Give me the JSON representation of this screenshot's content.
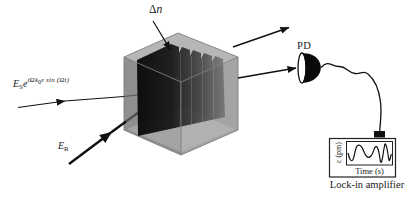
{
  "figure": {
    "type": "optics-experiment-diagram",
    "labels": {
      "grating": {
        "delta": "Δ",
        "n": "n"
      },
      "signal_beam": {
        "E": "E",
        "E_sub": "S",
        "e": "e",
        "exp_i": "iΩ",
        "exp_k": "k",
        "exp_k_sub": "0",
        "exp_tail": "ε sin (Ωt)"
      },
      "reference_beam": {
        "E": "E",
        "E_sub": "R"
      },
      "photodetector": "PD"
    },
    "lockin": {
      "ylabel": "ε (pm)",
      "xlabel": "Time (s)",
      "caption": "Lock-in amplifier"
    },
    "colors": {
      "cube_top": "#b6b6b6",
      "cube_left": "#8f8f8f",
      "cube_right": "#a4a4a4",
      "grating_dark": "#0d0d0d",
      "ink": "#1a1a1a",
      "background": "#ffffff"
    }
  }
}
